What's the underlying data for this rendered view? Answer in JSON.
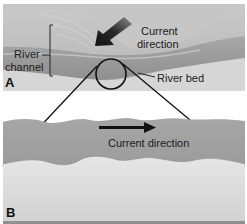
{
  "panel_a": {
    "letter": "A",
    "labels": {
      "current_direction_line1": "Current",
      "current_direction_line2": "direction",
      "river_channel_line1": "River",
      "river_channel_line2": "channel",
      "river_bed": "River bed"
    },
    "arrow": {
      "direction": "down-left",
      "icon": "arrow-down-left-icon"
    },
    "magnifier_circle": true
  },
  "panel_b": {
    "letter": "B",
    "labels": {
      "current_direction": "Current direction"
    },
    "arrow": {
      "direction": "right",
      "icon": "arrow-right-icon"
    }
  },
  "colors": {
    "sand_light": "#d8d8d8",
    "water_mid": "#9c9c9c",
    "bank_grey": "#bdbdbd",
    "line": "#111111"
  }
}
